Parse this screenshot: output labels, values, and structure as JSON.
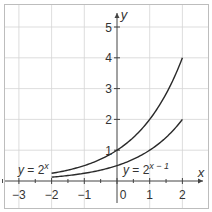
{
  "chart_data": {
    "type": "line",
    "title": "",
    "xlabel": "x",
    "ylabel": "y",
    "xlim": [
      -3.5,
      2.8
    ],
    "ylim": [
      -0.8,
      5.5
    ],
    "x_ticks": [
      -3,
      -2,
      -1,
      0,
      1,
      2
    ],
    "x_tick_labels": [
      "−3",
      "−2",
      "−1",
      "0",
      "1",
      "2"
    ],
    "y_ticks": [
      1,
      2,
      3,
      4,
      5
    ],
    "y_tick_labels": [
      "1",
      "2",
      "3",
      "4",
      "5"
    ],
    "grid": true,
    "series": [
      {
        "name": "y = 2^x",
        "label_text": "y = 2",
        "label_sup": "x",
        "x": [
          -2,
          -1.5,
          -1,
          -0.5,
          0,
          0.5,
          1,
          1.5,
          2
        ],
        "values": [
          0.25,
          0.354,
          0.5,
          0.707,
          1,
          1.414,
          2,
          2.828,
          4
        ]
      },
      {
        "name": "y = 2^(x−1)",
        "label_text": "y = 2",
        "label_sup": "x − 1",
        "x": [
          -2,
          -1.5,
          -1,
          -0.5,
          0,
          0.5,
          1,
          1.5,
          2
        ],
        "values": [
          0.125,
          0.177,
          0.25,
          0.354,
          0.5,
          0.707,
          1,
          1.414,
          2
        ]
      }
    ]
  }
}
